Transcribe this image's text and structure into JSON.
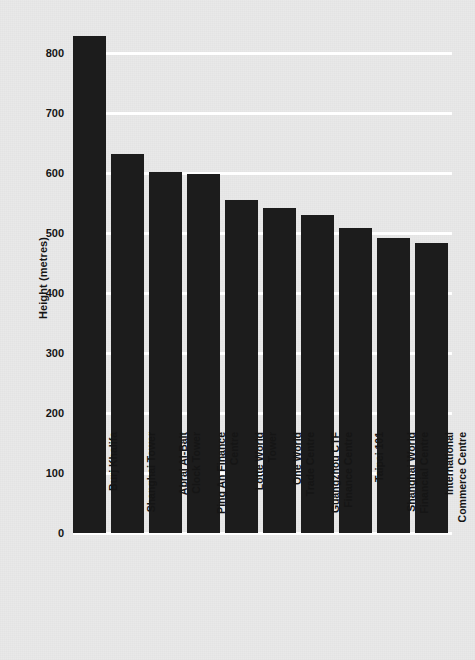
{
  "chart_data": {
    "type": "bar",
    "title": "",
    "subtitle": "",
    "xlabel": "",
    "ylabel": "Height (metres)",
    "ylim": [
      0,
      870
    ],
    "yticks": [
      0,
      100,
      200,
      300,
      400,
      500,
      600,
      700,
      800
    ],
    "ytick_labels": [
      "0",
      "100",
      "200",
      "300",
      "400",
      "500",
      "600",
      "700",
      "800"
    ],
    "grid": "horizontal-only-white",
    "legend": "none",
    "bar_color": "#1c1c1c",
    "background_color": "#e9e9e9",
    "gridline_color": "#ffffff",
    "categories": [
      "Burj Khalifa",
      "Shanghai Tower",
      "Abraj Al-Bait Clock Tower",
      "Ping An Finance Centre",
      "Lotte World Tower",
      "One World Trade Centre",
      "Guangzhou CTF Finance Centre",
      "Taipei 101",
      "Shanghai World Financial Centre",
      "International Commerce Centre"
    ],
    "category_lines": [
      [
        "Burj Khalifa"
      ],
      [
        "Shanghai Tower"
      ],
      [
        "Abraj Al-Bait",
        "Clock Tower"
      ],
      [
        "Ping An Finance",
        "Centre"
      ],
      [
        "Lotte World",
        "Tower"
      ],
      [
        "One World",
        "Trade Centre"
      ],
      [
        "Guangzhou CTF",
        "Finance Centre"
      ],
      [
        "Taipei 101"
      ],
      [
        "Shanghai World",
        "Financial Centre"
      ],
      [
        "International",
        "Commerce Centre"
      ]
    ],
    "values": [
      828,
      632,
      601,
      599,
      555,
      541,
      530,
      508,
      492,
      484
    ]
  }
}
